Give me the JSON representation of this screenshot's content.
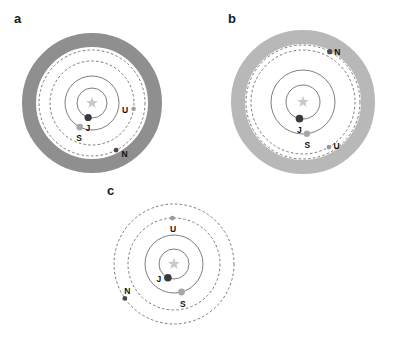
{
  "figure": {
    "type": "orbital-architecture-diagram",
    "background": "#ffffff",
    "width": 402,
    "height": 348,
    "palette": {
      "annulus_dark": "#8f8f8f",
      "annulus_light": "#b8b8b8",
      "orbit_solid": "#6f6f6f",
      "orbit_dashed": "#7a7a7a",
      "star_color": "#c9c9c9",
      "jupiter_color": "#3a3a3a",
      "saturn_color": "#a8a8a8",
      "uranus_color": "#9a9a9a",
      "neptune_color": "#4a4a4a",
      "label_color": "#111111"
    }
  },
  "chart_data": {
    "type": "scatter",
    "title": "",
    "xlabel": "",
    "ylabel": "",
    "legend": [],
    "grid": false,
    "panels": [
      {
        "id": "a",
        "label": "a",
        "center": [
          92,
          103
        ],
        "has_annulus": true,
        "annulus": {
          "inner_radius": 56,
          "outer_radius": 70,
          "color": "#8f8f8f"
        },
        "orbits": [
          {
            "body": "J",
            "radius": 15,
            "style": "solid"
          },
          {
            "body": "S",
            "radius": 27,
            "style": "solid"
          },
          {
            "body": "U",
            "radius": 42,
            "style": "dashed"
          },
          {
            "body": "N",
            "radius": 53,
            "style": "dashed"
          }
        ],
        "bodies": [
          {
            "name": "star",
            "symbol": "star",
            "angle_deg": 0,
            "radius": 0,
            "marker_r": 0,
            "color": "#c9c9c9",
            "label": ""
          },
          {
            "name": "Jupiter",
            "label": "J",
            "angle_deg": 255,
            "radius": 15,
            "marker_r": 3.6,
            "color": "#3a3a3a",
            "label_dx": 0,
            "label_dy": 11
          },
          {
            "name": "Saturn",
            "label": "S",
            "angle_deg": 243,
            "radius": 27,
            "marker_r": 3.4,
            "color": "#a8a8a8",
            "label_dx": -1,
            "label_dy": 11
          },
          {
            "name": "Uranus",
            "label": "U",
            "angle_deg": 352,
            "radius": 42,
            "marker_r": 2.2,
            "color": "#9a9a9a",
            "label_dx": -9,
            "label_dy": 2
          },
          {
            "name": "Neptune",
            "label": "N",
            "angle_deg": 297,
            "radius": 53,
            "marker_r": 2.4,
            "color": "#4a4a4a",
            "label_dx": 8,
            "label_dy": 4
          }
        ]
      },
      {
        "id": "b",
        "label": "b",
        "center": [
          303,
          102
        ],
        "has_annulus": true,
        "annulus": {
          "inner_radius": 58,
          "outer_radius": 72,
          "color": "#b8b8b8"
        },
        "orbits": [
          {
            "body": "J",
            "radius": 17,
            "style": "solid"
          },
          {
            "body": "S",
            "radius": 32,
            "style": "solid"
          },
          {
            "body": "U",
            "radius": 52,
            "style": "dashed"
          },
          {
            "body": "N",
            "radius": 57,
            "style": "dashed"
          }
        ],
        "bodies": [
          {
            "name": "star",
            "symbol": "star",
            "angle_deg": 0,
            "radius": 0,
            "marker_r": 0,
            "color": "#c9c9c9",
            "label": ""
          },
          {
            "name": "Jupiter",
            "label": "J",
            "angle_deg": 258,
            "radius": 17,
            "marker_r": 3.8,
            "color": "#3a3a3a",
            "label_dx": 0,
            "label_dy": 12
          },
          {
            "name": "Saturn",
            "label": "S",
            "angle_deg": 277,
            "radius": 32,
            "marker_r": 3.2,
            "color": "#a8a8a8",
            "label_dx": 0,
            "label_dy": 12
          },
          {
            "name": "Uranus",
            "label": "U",
            "angle_deg": 300,
            "radius": 52,
            "marker_r": 2.4,
            "color": "#9a9a9a",
            "label_dx": 7,
            "label_dy": -1
          },
          {
            "name": "Neptune",
            "label": "N",
            "angle_deg": 62,
            "radius": 57,
            "marker_r": 2.6,
            "color": "#4a4a4a",
            "label_dx": 7,
            "label_dy": 1
          }
        ]
      },
      {
        "id": "c",
        "label": "c",
        "center": [
          174,
          264
        ],
        "has_annulus": false,
        "annulus": null,
        "orbits": [
          {
            "body": "J",
            "radius": 15,
            "style": "solid"
          },
          {
            "body": "S",
            "radius": 29,
            "style": "solid"
          },
          {
            "body": "U",
            "radius": 46,
            "style": "dashed"
          },
          {
            "body": "N",
            "radius": 60,
            "style": "dashed"
          }
        ],
        "bodies": [
          {
            "name": "star",
            "symbol": "star",
            "angle_deg": 0,
            "radius": 0,
            "marker_r": 0,
            "color": "#c9c9c9",
            "label": ""
          },
          {
            "name": "Jupiter",
            "label": "J",
            "angle_deg": 246,
            "radius": 15,
            "marker_r": 3.8,
            "color": "#3a3a3a",
            "label_dx": -9,
            "label_dy": 2
          },
          {
            "name": "Saturn",
            "label": "S",
            "angle_deg": 285,
            "radius": 29,
            "marker_r": 3.4,
            "color": "#a8a8a8",
            "label_dx": 1,
            "label_dy": 12
          },
          {
            "name": "Uranus",
            "label": "U",
            "angle_deg": 92,
            "radius": 46,
            "marker_r": 2.4,
            "color": "#9a9a9a",
            "label_dx": 0,
            "label_dy": 11
          },
          {
            "name": "Neptune",
            "label": "N",
            "angle_deg": 215,
            "radius": 60,
            "marker_r": 2.4,
            "color": "#4a4a4a",
            "label_dx": 2,
            "label_dy": -7
          }
        ]
      }
    ]
  }
}
